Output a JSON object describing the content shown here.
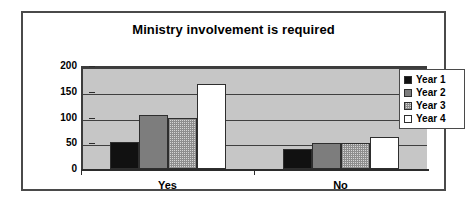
{
  "chart_data": {
    "type": "bar",
    "title": "Ministry involvement is required",
    "xlabel": "",
    "ylabel": "",
    "categories": [
      "Yes",
      "No"
    ],
    "series": [
      {
        "name": "Year 1",
        "values": [
          53,
          38
        ],
        "color": "#111111"
      },
      {
        "name": "Year 2",
        "values": [
          104,
          50
        ],
        "color": "#7d7d7d"
      },
      {
        "name": "Year 3",
        "values": [
          100,
          50
        ],
        "color": "#d6d6d6"
      },
      {
        "name": "Year 4",
        "values": [
          165,
          63
        ],
        "color": "#ffffff"
      }
    ],
    "ylim": [
      0,
      200
    ],
    "yticks": [
      0,
      50,
      100,
      150,
      200
    ],
    "ytick_labels": [
      "0",
      "50",
      "100",
      "150",
      "200"
    ],
    "grid": true,
    "legend_position": "right",
    "plot_background": "#c6c6c6",
    "frame_color": "#4a4a4a"
  },
  "legend": {
    "items": [
      {
        "label": "Year 1"
      },
      {
        "label": "Year 2"
      },
      {
        "label": "Year 3"
      },
      {
        "label": "Year 4"
      }
    ]
  }
}
